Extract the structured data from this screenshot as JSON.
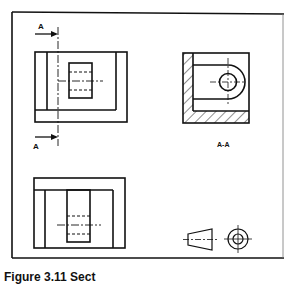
{
  "diagram": {
    "type": "orthographic technical drawing with section view",
    "labels": {
      "cutting_plane_top": "A",
      "cutting_plane_bottom": "A",
      "section_view": "A-A"
    },
    "views": [
      {
        "name": "front-view",
        "position": "top-left"
      },
      {
        "name": "section-view-a-a",
        "position": "top-right",
        "hatched": true
      },
      {
        "name": "plan-view",
        "position": "bottom-left"
      },
      {
        "name": "projection-symbol",
        "position": "bottom-right",
        "description": "third angle projection symbol"
      }
    ],
    "colors": {
      "line": "#111111",
      "background": "#ffffff"
    }
  },
  "caption": {
    "text": "Figure 3.11 Sect"
  }
}
